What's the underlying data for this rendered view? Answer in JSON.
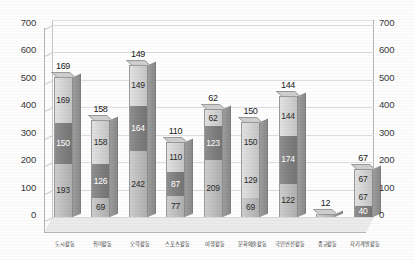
{
  "chart_data": {
    "type": "bar",
    "subtype": "stacked-bar-3d",
    "title": "",
    "xlabel": "",
    "ylabel": "",
    "ylim": [
      0,
      700
    ],
    "y_ticks": [
      0,
      100,
      200,
      300,
      400,
      500,
      600,
      700
    ],
    "y_axis_left_ticks": [
      "0",
      "100",
      "200",
      "300",
      "400",
      "500",
      "600",
      "700"
    ],
    "y_axis_right_ticks": [
      "0",
      "100",
      "200",
      "300",
      "400",
      "500",
      "600",
      "700"
    ],
    "grid": true,
    "legend": "none",
    "categories": [
      "도시활동",
      "취미활동",
      "오락활동",
      "스포츠활동",
      "여행활동",
      "문화예술활동",
      "국민안전활동",
      "종교활동",
      "자기계발활동"
    ],
    "series": [
      {
        "name": "하단",
        "values": [
          193,
          69,
          242,
          77,
          209,
          69,
          122,
          12,
          40
        ]
      },
      {
        "name": "중단",
        "values": [
          150,
          126,
          164,
          87,
          123,
          129,
          174,
          0,
          67
        ]
      },
      {
        "name": "상단",
        "values": [
          169,
          158,
          149,
          110,
          62,
          150,
          144,
          0,
          67
        ]
      }
    ],
    "totals": [
      512,
      353,
      555,
      274,
      394,
      348,
      440,
      12,
      174
    ],
    "bar_labels": [
      {
        "bottom": "193",
        "middle": "150",
        "top": "169"
      },
      {
        "bottom": "69",
        "middle": "126",
        "top": "158"
      },
      {
        "bottom": "242",
        "middle": "164",
        "top": "149"
      },
      {
        "bottom": "77",
        "middle": "87",
        "top": "110"
      },
      {
        "bottom": "209",
        "middle": "123",
        "top": "62"
      },
      {
        "bottom": "69",
        "middle": "129",
        "top": "150"
      },
      {
        "bottom": "122",
        "middle": "174",
        "top": "144"
      },
      {
        "bottom": "",
        "middle": "",
        "top": "12"
      },
      {
        "bottom": "40",
        "middle": "67",
        "top": "67"
      }
    ],
    "colors": {
      "segment_light": "#d2d2d2",
      "segment_mid": "#bcbcbc",
      "segment_dark": "#7e7e7e",
      "gridline": "#dcdcdc",
      "axis": "#b5b5b5",
      "floor": "#ebebeb",
      "text": "#2a2a2a",
      "background": "#ffffff"
    }
  }
}
